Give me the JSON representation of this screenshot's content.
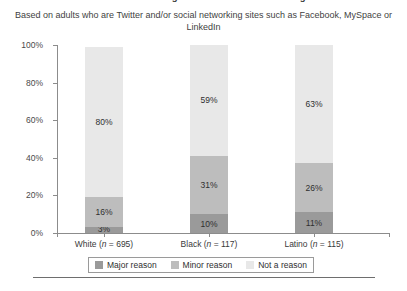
{
  "title": "Reasons for not using Twitter or social networking sites",
  "subtitle": "Based on adults who are Twitter and/or social networking sites such as Facebook, MySpace or LinkedIn",
  "legend": {
    "items": [
      {
        "label": "Major reason",
        "color": "#9a9a9a",
        "swatch_name": "legend-swatch-major"
      },
      {
        "label": "Minor reason",
        "color": "#bdbdbd",
        "swatch_name": "legend-swatch-minor"
      },
      {
        "label": "Not a reason",
        "color": "#e8e8e8",
        "swatch_name": "legend-swatch-not"
      }
    ]
  },
  "axis": {
    "y_ticks": [
      "0%",
      "20%",
      "40%",
      "60%",
      "80%",
      "100%"
    ]
  },
  "categories": [
    {
      "name": "White",
      "n": "695",
      "label": "White (n = 695)"
    },
    {
      "name": "Black",
      "n": "117",
      "label": "Black (n = 117)"
    },
    {
      "name": "Latino",
      "n": "115",
      "label": "Latino (n = 115)"
    }
  ],
  "bars": [
    {
      "category": "White",
      "segments": [
        {
          "series": "Not a reason",
          "value": 80,
          "label": "80%"
        },
        {
          "series": "Minor reason",
          "value": 16,
          "label": "16%"
        },
        {
          "series": "Major reason",
          "value": 3,
          "label": "3%"
        }
      ]
    },
    {
      "category": "Black",
      "segments": [
        {
          "series": "Not a reason",
          "value": 59,
          "label": "59%"
        },
        {
          "series": "Minor reason",
          "value": 31,
          "label": "31%"
        },
        {
          "series": "Major reason",
          "value": 10,
          "label": "10%"
        }
      ]
    },
    {
      "category": "Latino",
      "segments": [
        {
          "series": "Not a reason",
          "value": 63,
          "label": "63%"
        },
        {
          "series": "Minor reason",
          "value": 26,
          "label": "26%"
        },
        {
          "series": "Major reason",
          "value": 11,
          "label": "11%"
        }
      ]
    }
  ],
  "chart_data": {
    "type": "bar",
    "subtype": "stacked-column-100",
    "title": "Reasons for not using Twitter or social networking sites",
    "subtitle": "Based on adults who are Twitter and/or social networking sites such as Facebook, MySpace or LinkedIn",
    "categories": [
      "White (n = 695)",
      "Black (n = 117)",
      "Latino (n = 115)"
    ],
    "series": [
      {
        "name": "Major reason",
        "values": [
          3,
          10,
          11
        ],
        "color": "#9a9a9a"
      },
      {
        "name": "Minor reason",
        "values": [
          16,
          31,
          26
        ],
        "color": "#bdbdbd"
      },
      {
        "name": "Not a reason",
        "values": [
          80,
          59,
          63
        ],
        "color": "#e8e8e8"
      }
    ],
    "stack_order_bottom_to_top": [
      "Major reason",
      "Minor reason",
      "Not a reason"
    ],
    "xlabel": "",
    "ylabel": "",
    "ylim": [
      0,
      100
    ],
    "yticks": [
      0,
      20,
      40,
      60,
      80,
      100
    ],
    "ytick_labels": [
      "0%",
      "20%",
      "40%",
      "60%",
      "80%",
      "100%"
    ],
    "grid": false,
    "legend_position": "bottom",
    "data_labels": true,
    "value_unit": "%"
  }
}
